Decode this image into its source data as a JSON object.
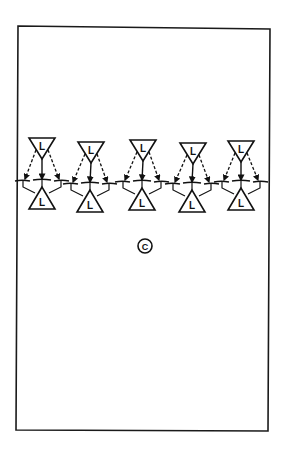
{
  "diagram": {
    "type": "drill-diagram",
    "field": {
      "border_color": "#1a1a1a",
      "background": "#ffffff"
    },
    "groups": [
      {
        "top_player": {
          "label": "L"
        },
        "bottom_player": {
          "label": "L"
        },
        "passes": {
          "center": "solid",
          "left": "dashed",
          "right": "dashed"
        }
      },
      {
        "top_player": {
          "label": "L"
        },
        "bottom_player": {
          "label": "L"
        },
        "passes": {
          "center": "solid",
          "left": "dashed",
          "right": "dashed"
        }
      },
      {
        "top_player": {
          "label": "L"
        },
        "bottom_player": {
          "label": "L"
        },
        "passes": {
          "center": "solid",
          "left": "dashed",
          "right": "dashed"
        }
      },
      {
        "top_player": {
          "label": "L"
        },
        "bottom_player": {
          "label": "L"
        },
        "passes": {
          "center": "solid",
          "left": "dashed",
          "right": "dashed"
        }
      },
      {
        "top_player": {
          "label": "L"
        },
        "bottom_player": {
          "label": "L"
        },
        "passes": {
          "center": "solid",
          "left": "dashed",
          "right": "dashed"
        }
      }
    ],
    "coach": {
      "label": "C"
    },
    "icons": {
      "player": "triangle-icon",
      "coach": "circle-icon",
      "pass_solid": "arrow-solid-icon",
      "pass_dashed": "arrow-dashed-icon",
      "gate": "cone-gate-icon"
    }
  }
}
